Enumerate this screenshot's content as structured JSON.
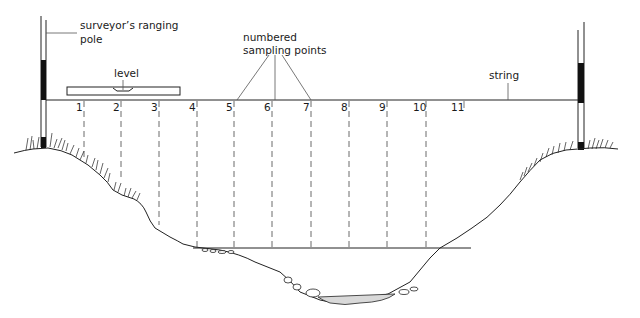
{
  "diagram": {
    "labels": {
      "pole": "surveyor's ranging pole",
      "pole_line1": "surveyor’s ranging",
      "pole_line2": "pole",
      "level": "level",
      "sampling_line1": "numbered",
      "sampling_line2": "sampling points",
      "string": "string"
    },
    "sampling_points": [
      {
        "n": "1",
        "x": 84
      },
      {
        "n": "2",
        "x": 121
      },
      {
        "n": "3",
        "x": 159
      },
      {
        "n": "4",
        "x": 197
      },
      {
        "n": "5",
        "x": 234
      },
      {
        "n": "6",
        "x": 272
      },
      {
        "n": "7",
        "x": 311
      },
      {
        "n": "8",
        "x": 349
      },
      {
        "n": "9",
        "x": 387
      },
      {
        "n": "10",
        "x": 426
      },
      {
        "n": "11",
        "x": 464
      }
    ],
    "colors": {
      "ink": "#1a1a1a",
      "background": "#ffffff",
      "water_fill": "#d9d9d9"
    }
  }
}
